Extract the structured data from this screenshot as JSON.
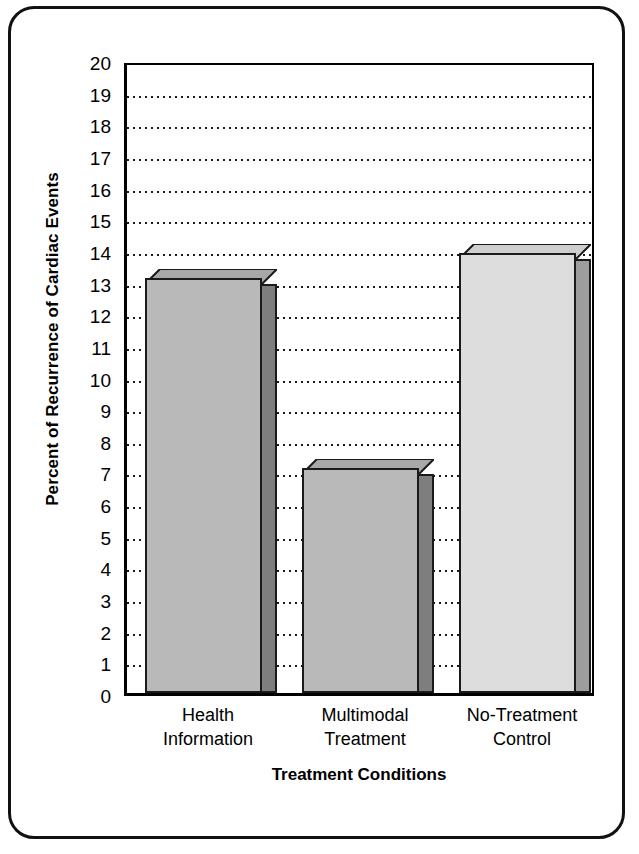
{
  "chart_data": {
    "type": "bar",
    "title": "",
    "xlabel": "Treatment Conditions",
    "ylabel": "Percent of Recurrence of Cardiac Events",
    "categories": [
      "Health Information",
      "Multimodal Treatment",
      "No-Treatment Control"
    ],
    "category_lines": [
      [
        "Health",
        "Information"
      ],
      [
        "Multimodal",
        "Treatment"
      ],
      [
        "No-Treatment",
        "Control"
      ]
    ],
    "values": [
      13.4,
      7.4,
      14.2
    ],
    "front_face_values": [
      13.1,
      7.1,
      13.9
    ],
    "ylim": [
      0,
      20
    ],
    "ytick_step": 1,
    "yticks": [
      0,
      1,
      2,
      3,
      4,
      5,
      6,
      7,
      8,
      9,
      10,
      11,
      12,
      13,
      14,
      15,
      16,
      17,
      18,
      19,
      20
    ],
    "ytick_labels": [
      "0",
      "1",
      "2",
      "3",
      "4",
      "5",
      "6",
      "7",
      "8",
      "9",
      "10",
      "11",
      "12",
      "13",
      "14",
      "15",
      "16",
      "17",
      "18",
      "19",
      "20"
    ],
    "grid": true,
    "grid_style": "dotted-horizontal",
    "legend": "none",
    "style": "3d-extruded-bars",
    "bar_colors": [
      "#b9b9b9",
      "#b9b9b9",
      "#dddddd"
    ],
    "bar_top_colors": [
      "#a8a8a8",
      "#a8a8a8",
      "#cfcfcf"
    ],
    "bar_side_colors": [
      "#7e7e7e",
      "#7e7e7e",
      "#9d9d9d"
    ],
    "bar_outline_color": "#1a1a1a",
    "axis_color": "#000000",
    "background_color": "#ffffff"
  },
  "frame": {
    "border_color": "#111111",
    "corner_style": "rounded"
  }
}
